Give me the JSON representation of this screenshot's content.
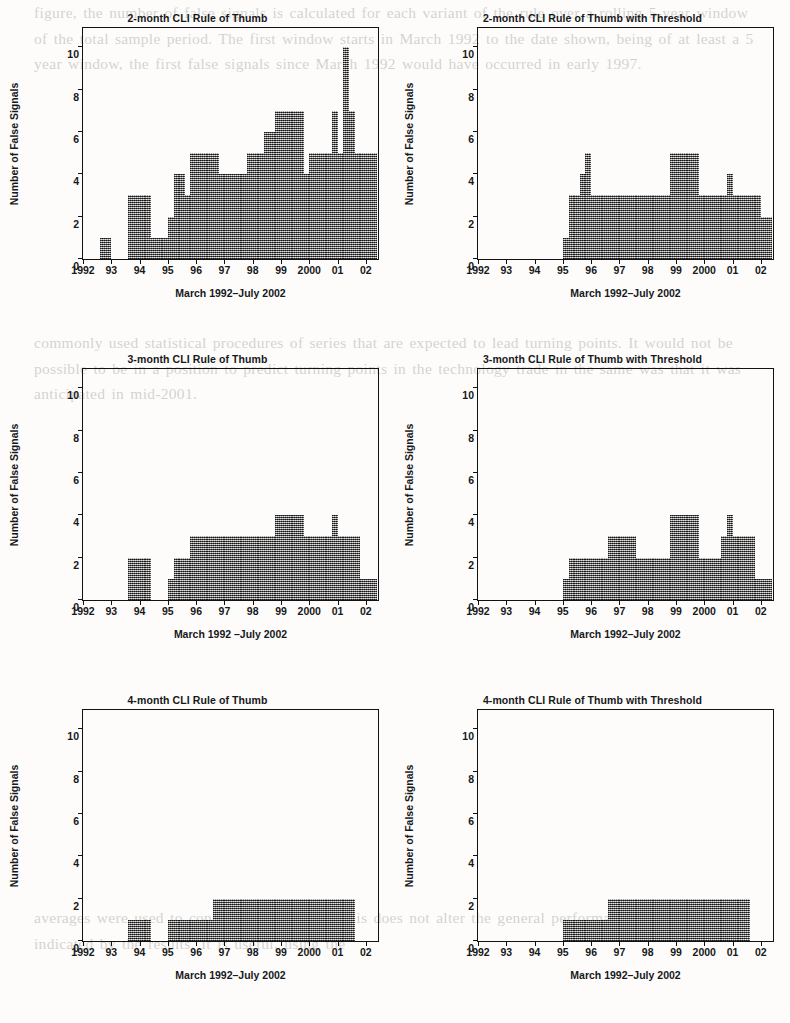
{
  "page": {
    "background_text_top": "figure, the number of false signals is calculated for each variant of the rule over a rolling 5-year window of the total sample period. The first window starts in March 1992 to the date shown, being of at least a 5 year window, the first false signals since March 1992 would have occurred in early 1997.",
    "background_text_mid": "commonly used statistical procedures of series that are expected to lead turning points. It would not be possible to be in a position to predict turning points in the technology trade in the same was that it was anticipated in mid-2001.",
    "background_text_bot": "averages were used to construct the CLI, but this does not alter the general performance of the rules indicated by the results. It is useful, using the"
  },
  "axis": {
    "ylabel": "Number of False Signals",
    "yticks": [
      0,
      2,
      4,
      6,
      8,
      10
    ],
    "ymin": 0,
    "ymax": 11,
    "xticks": [
      "1992",
      "93",
      "94",
      "95",
      "96",
      "97",
      "98",
      "99",
      "2000",
      "01",
      "02"
    ],
    "xmin": 1992,
    "xmax": 2002.5,
    "xlabel": "March 1992–July 2002",
    "xlabel_alt": "March 1992 –July 2002"
  },
  "style": {
    "bar_color": "#8c8c8c",
    "frame_color": "#111111",
    "text_color": "#16181a",
    "page_background": "#fdfcfa"
  },
  "chart_data": [
    {
      "id": "cli-2month",
      "type": "bar",
      "title": "2-month CLI Rule of Thumb",
      "xlabel": "March 1992–July 2002",
      "ylabel": "Number of False Signals",
      "ylim": [
        0,
        11
      ],
      "xlim": [
        1992.0,
        2002.5
      ],
      "grid": false,
      "legend": "none",
      "x": [
        1992.0,
        1992.2,
        1992.4,
        1992.6,
        1992.8,
        1993.0,
        1993.2,
        1993.4,
        1993.6,
        1993.8,
        1994.0,
        1994.2,
        1994.4,
        1994.6,
        1994.8,
        1995.0,
        1995.2,
        1995.4,
        1995.6,
        1995.8,
        1996.0,
        1996.2,
        1996.4,
        1996.6,
        1996.8,
        1997.0,
        1997.2,
        1997.4,
        1997.6,
        1997.8,
        1998.0,
        1998.2,
        1998.4,
        1998.6,
        1998.8,
        1999.0,
        1999.2,
        1999.4,
        1999.6,
        1999.8,
        2000.0,
        2000.2,
        2000.4,
        2000.6,
        2000.8,
        2001.0,
        2001.2,
        2001.4,
        2001.6,
        2001.8,
        2002.0,
        2002.2
      ],
      "values": [
        0,
        0,
        0,
        1,
        1,
        0,
        0,
        0,
        3,
        3,
        3,
        3,
        1,
        1,
        1,
        2,
        4,
        4,
        3,
        5,
        5,
        5,
        5,
        5,
        4,
        4,
        4,
        4,
        4,
        5,
        5,
        5,
        6,
        6,
        7,
        7,
        7,
        7,
        7,
        4,
        5,
        5,
        5,
        5,
        7,
        5,
        10,
        7,
        5,
        5,
        5,
        5
      ],
      "ymax_observed": 10
    },
    {
      "id": "cli-2month-threshold",
      "type": "bar",
      "title": "2-month CLI Rule of Thumb with Threshold",
      "xlabel": "March 1992–July 2002",
      "ylabel": "Number of False Signals",
      "ylim": [
        0,
        11
      ],
      "xlim": [
        1992.0,
        2002.5
      ],
      "grid": false,
      "legend": "none",
      "x": [
        1992.0,
        1992.2,
        1992.4,
        1992.6,
        1992.8,
        1993.0,
        1993.2,
        1993.4,
        1993.6,
        1993.8,
        1994.0,
        1994.2,
        1994.4,
        1994.6,
        1994.8,
        1995.0,
        1995.2,
        1995.4,
        1995.6,
        1995.8,
        1996.0,
        1996.2,
        1996.4,
        1996.6,
        1996.8,
        1997.0,
        1997.2,
        1997.4,
        1997.6,
        1997.8,
        1998.0,
        1998.2,
        1998.4,
        1998.6,
        1998.8,
        1999.0,
        1999.2,
        1999.4,
        1999.6,
        1999.8,
        2000.0,
        2000.2,
        2000.4,
        2000.6,
        2000.8,
        2001.0,
        2001.2,
        2001.4,
        2001.6,
        2001.8,
        2002.0,
        2002.2
      ],
      "values": [
        0,
        0,
        0,
        0,
        0,
        0,
        0,
        0,
        0,
        0,
        0,
        0,
        0,
        0,
        0,
        1,
        3,
        3,
        4,
        5,
        3,
        3,
        3,
        3,
        3,
        3,
        3,
        3,
        3,
        3,
        3,
        3,
        3,
        3,
        5,
        5,
        5,
        5,
        5,
        3,
        3,
        3,
        3,
        3,
        4,
        3,
        3,
        3,
        3,
        3,
        2,
        2
      ],
      "ymax_observed": 5
    },
    {
      "id": "cli-3month",
      "type": "bar",
      "title": "3-month CLI Rule of Thumb",
      "xlabel": "March 1992 –July 2002",
      "ylabel": "Number of False Signals",
      "ylim": [
        0,
        11
      ],
      "xlim": [
        1992.0,
        2002.5
      ],
      "grid": false,
      "legend": "none",
      "x": [
        1992.0,
        1992.2,
        1992.4,
        1992.6,
        1992.8,
        1993.0,
        1993.2,
        1993.4,
        1993.6,
        1993.8,
        1994.0,
        1994.2,
        1994.4,
        1994.6,
        1994.8,
        1995.0,
        1995.2,
        1995.4,
        1995.6,
        1995.8,
        1996.0,
        1996.2,
        1996.4,
        1996.6,
        1996.8,
        1997.0,
        1997.2,
        1997.4,
        1997.6,
        1997.8,
        1998.0,
        1998.2,
        1998.4,
        1998.6,
        1998.8,
        1999.0,
        1999.2,
        1999.4,
        1999.6,
        1999.8,
        2000.0,
        2000.2,
        2000.4,
        2000.6,
        2000.8,
        2001.0,
        2001.2,
        2001.4,
        2001.6,
        2001.8,
        2002.0,
        2002.2
      ],
      "values": [
        0,
        0,
        0,
        0,
        0,
        0,
        0,
        0,
        2,
        2,
        2,
        2,
        0,
        0,
        0,
        1,
        2,
        2,
        2,
        3,
        3,
        3,
        3,
        3,
        3,
        3,
        3,
        3,
        3,
        3,
        3,
        3,
        3,
        3,
        4,
        4,
        4,
        4,
        4,
        3,
        3,
        3,
        3,
        3,
        4,
        3,
        3,
        3,
        3,
        1,
        1,
        1
      ],
      "ymax_observed": 4
    },
    {
      "id": "cli-3month-threshold",
      "type": "bar",
      "title": "3-month CLI Rule of Thumb with Threshold",
      "xlabel": "March 1992–July 2002",
      "ylabel": "Number of False Signals",
      "ylim": [
        0,
        11
      ],
      "xlim": [
        1992.0,
        2002.5
      ],
      "grid": false,
      "legend": "none",
      "x": [
        1992.0,
        1992.2,
        1992.4,
        1992.6,
        1992.8,
        1993.0,
        1993.2,
        1993.4,
        1993.6,
        1993.8,
        1994.0,
        1994.2,
        1994.4,
        1994.6,
        1994.8,
        1995.0,
        1995.2,
        1995.4,
        1995.6,
        1995.8,
        1996.0,
        1996.2,
        1996.4,
        1996.6,
        1996.8,
        1997.0,
        1997.2,
        1997.4,
        1997.6,
        1997.8,
        1998.0,
        1998.2,
        1998.4,
        1998.6,
        1998.8,
        1999.0,
        1999.2,
        1999.4,
        1999.6,
        1999.8,
        2000.0,
        2000.2,
        2000.4,
        2000.6,
        2000.8,
        2001.0,
        2001.2,
        2001.4,
        2001.6,
        2001.8,
        2002.0,
        2002.2
      ],
      "values": [
        0,
        0,
        0,
        0,
        0,
        0,
        0,
        0,
        0,
        0,
        0,
        0,
        0,
        0,
        0,
        1,
        2,
        2,
        2,
        2,
        2,
        2,
        2,
        3,
        3,
        3,
        3,
        3,
        2,
        2,
        2,
        2,
        2,
        2,
        4,
        4,
        4,
        4,
        4,
        2,
        2,
        2,
        2,
        3,
        4,
        3,
        3,
        3,
        3,
        1,
        1,
        1
      ],
      "ymax_observed": 4
    },
    {
      "id": "cli-4month",
      "type": "bar",
      "title": "4-month CLI Rule of Thumb",
      "xlabel": "March 1992–July 2002",
      "ylabel": "Number of False Signals",
      "ylim": [
        0,
        11
      ],
      "xlim": [
        1992.0,
        2002.5
      ],
      "grid": false,
      "legend": "none",
      "x": [
        1992.0,
        1992.2,
        1992.4,
        1992.6,
        1992.8,
        1993.0,
        1993.2,
        1993.4,
        1993.6,
        1993.8,
        1994.0,
        1994.2,
        1994.4,
        1994.6,
        1994.8,
        1995.0,
        1995.2,
        1995.4,
        1995.6,
        1995.8,
        1996.0,
        1996.2,
        1996.4,
        1996.6,
        1996.8,
        1997.0,
        1997.2,
        1997.4,
        1997.6,
        1997.8,
        1998.0,
        1998.2,
        1998.4,
        1998.6,
        1998.8,
        1999.0,
        1999.2,
        1999.4,
        1999.6,
        1999.8,
        2000.0,
        2000.2,
        2000.4,
        2000.6,
        2000.8,
        2001.0,
        2001.2,
        2001.4,
        2001.6,
        2001.8,
        2002.0,
        2002.2
      ],
      "values": [
        0,
        0,
        0,
        0,
        0,
        0,
        0,
        0,
        1,
        1,
        1,
        1,
        0,
        0,
        0,
        1,
        1,
        1,
        1,
        1,
        1,
        1,
        1,
        2,
        2,
        2,
        2,
        2,
        2,
        2,
        2,
        2,
        2,
        2,
        2,
        2,
        2,
        2,
        2,
        2,
        2,
        2,
        2,
        2,
        2,
        2,
        2,
        2,
        0,
        0,
        0,
        0
      ],
      "ymax_observed": 2
    },
    {
      "id": "cli-4month-threshold",
      "type": "bar",
      "title": "4-month CLI Rule of Thumb with Threshold",
      "xlabel": "March 1992–July 2002",
      "ylabel": "Number of False Signals",
      "ylim": [
        0,
        11
      ],
      "xlim": [
        1992.0,
        2002.5
      ],
      "grid": false,
      "legend": "none",
      "x": [
        1992.0,
        1992.2,
        1992.4,
        1992.6,
        1992.8,
        1993.0,
        1993.2,
        1993.4,
        1993.6,
        1993.8,
        1994.0,
        1994.2,
        1994.4,
        1994.6,
        1994.8,
        1995.0,
        1995.2,
        1995.4,
        1995.6,
        1995.8,
        1996.0,
        1996.2,
        1996.4,
        1996.6,
        1996.8,
        1997.0,
        1997.2,
        1997.4,
        1997.6,
        1997.8,
        1998.0,
        1998.2,
        1998.4,
        1998.6,
        1998.8,
        1999.0,
        1999.2,
        1999.4,
        1999.6,
        1999.8,
        2000.0,
        2000.2,
        2000.4,
        2000.6,
        2000.8,
        2001.0,
        2001.2,
        2001.4,
        2001.6,
        2001.8,
        2002.0,
        2002.2
      ],
      "values": [
        0,
        0,
        0,
        0,
        0,
        0,
        0,
        0,
        0,
        0,
        0,
        0,
        0,
        0,
        0,
        1,
        1,
        1,
        1,
        1,
        1,
        1,
        1,
        2,
        2,
        2,
        2,
        2,
        2,
        2,
        2,
        2,
        2,
        2,
        2,
        2,
        2,
        2,
        2,
        2,
        2,
        2,
        2,
        2,
        2,
        2,
        2,
        2,
        0,
        0,
        0,
        0
      ],
      "ymax_observed": 2
    }
  ]
}
